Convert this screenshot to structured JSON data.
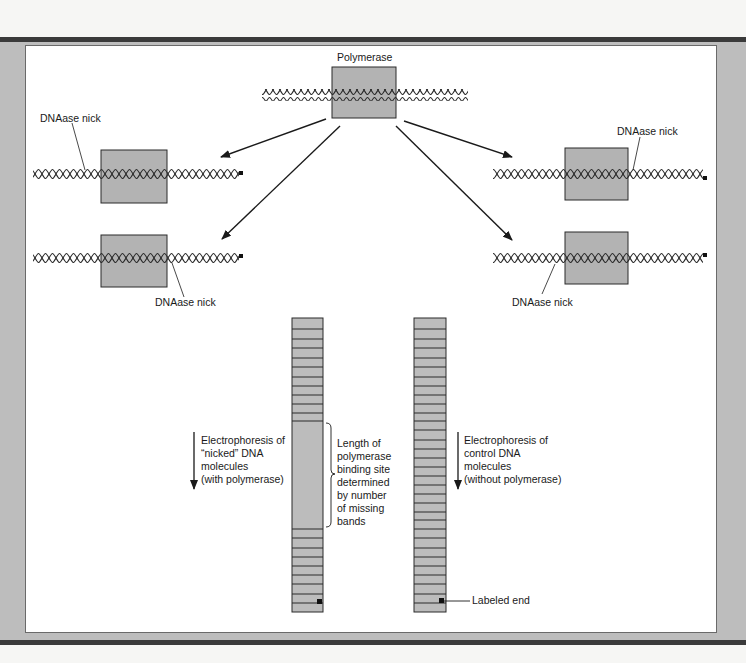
{
  "figure": {
    "top": {
      "protein_label": "Polymerase"
    },
    "nicked_molecules": [
      {
        "side": "left",
        "row": 1,
        "nick_label": "DNAase nick",
        "nick_position": "left of polymerase"
      },
      {
        "side": "left",
        "row": 2,
        "nick_label": "DNAase nick",
        "nick_position": "right of polymerase"
      },
      {
        "side": "right",
        "row": 1,
        "nick_label": "DNAase nick",
        "nick_position": "right of polymerase"
      },
      {
        "side": "right",
        "row": 2,
        "nick_label": "DNAase nick",
        "nick_position": "left of polymerase"
      }
    ],
    "gel": {
      "left_lane": {
        "caption_lines": [
          "Electrophoresis of",
          "“nicked” DNA",
          "molecules",
          "(with polymerase)"
        ],
        "bands_top": 11,
        "missing_region": true,
        "bands_bottom": 9
      },
      "right_lane": {
        "caption_lines": [
          "Electrophoresis of",
          "control DNA",
          "molecules",
          "(without polymerase)"
        ],
        "bands": 28
      },
      "bracket_caption_lines": [
        "Length of",
        "polymerase",
        "binding site",
        "determined",
        "by number",
        "of missing",
        "bands"
      ],
      "labeled_end_label": "Labeled end"
    },
    "colors": {
      "protein_fill": "#b3b3b3",
      "lane_fill": "#bcbcbc",
      "frame": "#bdbdbd",
      "rule": "#3a3a3a",
      "ink": "#1a1a1a"
    }
  }
}
